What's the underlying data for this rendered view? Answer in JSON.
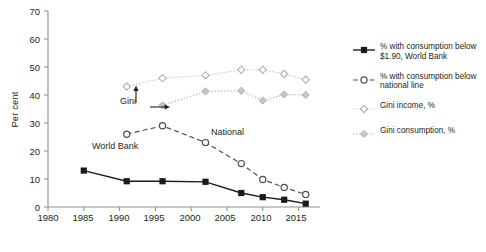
{
  "chart_data": {
    "type": "line",
    "title": "",
    "xlabel": "",
    "ylabel": "Per cent",
    "xlim": [
      1980,
      2018
    ],
    "ylim": [
      0,
      70
    ],
    "xticks": [
      1980,
      1985,
      1990,
      1995,
      2000,
      2005,
      2010,
      2015
    ],
    "yticks": [
      0,
      10,
      20,
      30,
      40,
      50,
      60,
      70
    ],
    "grid": false,
    "legend_position": "right",
    "series": [
      {
        "name": "% with consumption below $1.90, World Bank",
        "legend_label": "% with consumption below\n$1.90, World Bank",
        "marker": "filled-square",
        "line_style": "solid",
        "color": "#1a1a1a",
        "x": [
          1985,
          1991,
          1996,
          2002,
          2007,
          2010,
          2013,
          2016
        ],
        "y": [
          13.0,
          9.2,
          9.2,
          9.0,
          5.0,
          3.5,
          2.6,
          1.2
        ]
      },
      {
        "name": "% with consumption below national line",
        "legend_label": "% with consumption below\nnational line",
        "marker": "open-circle",
        "line_style": "dashed",
        "color": "#4d4d4d",
        "x": [
          1991,
          1996,
          2002,
          2007,
          2010,
          2013,
          2016
        ],
        "y": [
          26.0,
          29.0,
          23.0,
          15.5,
          9.8,
          7.0,
          4.5
        ]
      },
      {
        "name": "Gini income, %",
        "legend_label": "Gini income, %",
        "marker": "open-diamond",
        "line_style": "dotted",
        "color": "#c8c8c8",
        "x": [
          1991,
          1996,
          2002,
          2007,
          2010,
          2013,
          2016
        ],
        "y": [
          43.0,
          46.0,
          47.0,
          49.0,
          49.0,
          47.5,
          45.5
        ]
      },
      {
        "name": "Gini consumption, %",
        "legend_label": "Gini consumption, %",
        "marker": "filled-diamond",
        "line_style": "dotted",
        "color": "#b4b4b4",
        "x": [
          1996,
          2002,
          2007,
          2010,
          2013,
          2016
        ],
        "y": [
          36.3,
          41.3,
          41.5,
          38.0,
          40.2,
          40.0
        ]
      }
    ],
    "annotations": [
      {
        "text": "Gini",
        "x": 1991,
        "y": 33
      },
      {
        "text": "National",
        "x": 2001,
        "y": 27
      },
      {
        "text": "World Bank",
        "x": 1987,
        "y": 13.5
      }
    ]
  },
  "axes": {
    "ylabel": "Per cent",
    "ytick_labels": [
      "0",
      "10",
      "20",
      "30",
      "40",
      "50",
      "60",
      "70"
    ],
    "xtick_labels": [
      "1980",
      "1985",
      "1990",
      "1995",
      "2000",
      "2005",
      "2010",
      "2015"
    ]
  },
  "legend": {
    "items": [
      {
        "label": "% with consumption below\n$1.90, World Bank",
        "marker": "filled-square",
        "line_style": "solid"
      },
      {
        "label": "% with consumption below\nnational line",
        "marker": "open-circle",
        "line_style": "dashed"
      },
      {
        "label": "Gini income, %",
        "marker": "open-diamond",
        "line_style": "dotted"
      },
      {
        "label": "Gini consumption, %",
        "marker": "filled-diamond",
        "line_style": "dotted"
      }
    ]
  },
  "annotations": {
    "gini": "Gini",
    "national": "National",
    "world_bank": "World Bank"
  },
  "caption": ""
}
